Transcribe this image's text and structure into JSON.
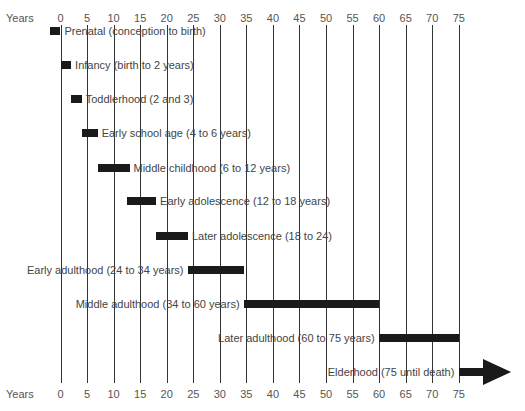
{
  "chart_data": {
    "type": "bar",
    "subtype": "gantt-timeline",
    "title": "",
    "xlabel": "Years",
    "ylabel": "",
    "xlim": [
      0,
      75
    ],
    "x_ticks": [
      0,
      5,
      10,
      15,
      20,
      25,
      30,
      35,
      40,
      45,
      50,
      55,
      60,
      65,
      70,
      75
    ],
    "axis_label_top": "Years",
    "axis_label_bottom": "Years",
    "grid": true,
    "legend": null,
    "stages": [
      {
        "label": "Prenatal (conception to birth)",
        "start": -2,
        "end": 0,
        "label_side": "right"
      },
      {
        "label": "Infancy (birth to 2 years)",
        "start": 0,
        "end": 2,
        "label_side": "right"
      },
      {
        "label": "Toddlerhood (2 and 3)",
        "start": 2,
        "end": 4,
        "label_side": "right"
      },
      {
        "label": "Early school age (4 to 6 years)",
        "start": 4,
        "end": 7,
        "label_side": "right"
      },
      {
        "label": "Middle childhood (6 to 12 years)",
        "start": 7,
        "end": 13,
        "label_side": "right"
      },
      {
        "label": "Early adolescence (12 to 18 years)",
        "start": 12.5,
        "end": 18,
        "label_side": "right"
      },
      {
        "label": "Later adolescence (18 to 24)",
        "start": 18,
        "end": 24,
        "label_side": "right"
      },
      {
        "label": "Early adulthood (24 to 34 years)",
        "start": 24,
        "end": 34.5,
        "label_side": "left"
      },
      {
        "label": "Middle adulthood (34 to 60 years)",
        "start": 34.5,
        "end": 60,
        "label_side": "left"
      },
      {
        "label": "Later adulthood (60 to 75 years)",
        "start": 60,
        "end": 75,
        "label_side": "left"
      },
      {
        "label": "Elderhood (75 until death)",
        "start": 75,
        "end": null,
        "label_side": "left",
        "arrow": true
      }
    ]
  },
  "colors": {
    "bar": "#1a1a1a",
    "grid": "#333333",
    "text": "#444444"
  }
}
